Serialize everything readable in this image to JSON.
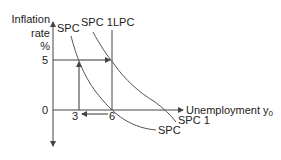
{
  "diagram": {
    "y_axis": {
      "label_line1": "Inflation",
      "label_line2": "rate",
      "label_line3": "%"
    },
    "x_axis": {
      "label": "Unemployment y",
      "label_subscript": "0"
    },
    "ticks": {
      "y_zero": "0",
      "y_five": "5",
      "x_three": "3",
      "x_six": "6"
    },
    "curves": {
      "spc_top_label": "SPC",
      "spc1_top_label": "SPC 1",
      "lpc_label": "LPC",
      "spc1_bottom_label": "SPC 1",
      "spc_bottom_label": "SPC"
    },
    "colors": {
      "line": "#444444",
      "text": "#222222",
      "background": "#ffffff"
    }
  }
}
